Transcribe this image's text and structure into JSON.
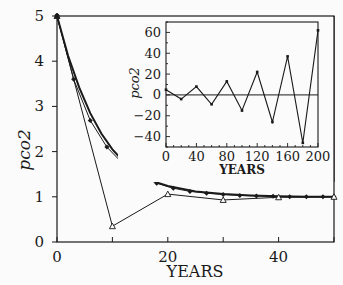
{
  "chart_data": [
    {
      "type": "line",
      "title": "",
      "xlabel": "YEARS",
      "ylabel": "pco2",
      "xlim": [
        0,
        50
      ],
      "ylim": [
        0,
        5
      ],
      "xticks": [
        0,
        20,
        40
      ],
      "yticks": [
        0,
        1,
        2,
        3,
        4,
        5
      ],
      "grid": false,
      "legend": null,
      "series": [
        {
          "name": "exact (thick line)",
          "marker": "none",
          "x": [
            0,
            2,
            4,
            6,
            8,
            10,
            12,
            14,
            16,
            18,
            20,
            25,
            30,
            35,
            40,
            45,
            50
          ],
          "values": [
            5.0,
            4.12,
            3.42,
            2.85,
            2.4,
            2.05,
            1.78,
            1.57,
            1.43,
            1.32,
            1.24,
            1.12,
            1.06,
            1.03,
            1.01,
            1.0,
            1.0
          ]
        },
        {
          "name": "dt=3 (diamonds)",
          "marker": "diamond",
          "x": [
            0,
            3,
            6,
            9,
            12,
            15,
            18,
            21,
            24,
            27,
            30,
            33,
            36,
            39,
            42,
            45,
            48,
            50
          ],
          "values": [
            5.0,
            3.6,
            2.69,
            2.1,
            1.72,
            1.47,
            1.3,
            1.19,
            1.12,
            1.08,
            1.05,
            1.03,
            1.02,
            1.01,
            1.0,
            1.0,
            1.0,
            1.0
          ]
        },
        {
          "name": "dt=10 (triangles)",
          "marker": "triangle",
          "x": [
            0,
            10,
            20,
            30,
            40,
            50
          ],
          "values": [
            5.0,
            0.35,
            1.06,
            0.93,
            0.99,
            1.0
          ]
        }
      ]
    },
    {
      "type": "line",
      "title": "inset",
      "xlabel": "YEARS",
      "ylabel": "pco2",
      "xlim": [
        0,
        200
      ],
      "ylim": [
        -50,
        70
      ],
      "xticks": [
        0,
        40,
        80,
        120,
        160,
        200
      ],
      "yticks": [
        -40,
        -20,
        0,
        20,
        40,
        60
      ],
      "grid": false,
      "reference_line": 0,
      "series": [
        {
          "name": "unstable oscillation",
          "marker": "dot",
          "x": [
            0,
            20,
            40,
            60,
            80,
            100,
            120,
            140,
            160,
            180,
            200
          ],
          "values": [
            5,
            -4,
            8,
            -9,
            13,
            -15,
            22,
            -26,
            37,
            -46,
            62
          ]
        }
      ]
    }
  ],
  "labels": {
    "main_xlabel": "YEARS",
    "main_ylabel": "pco2",
    "inset_xlabel": "YEARS",
    "inset_ylabel": "pco2",
    "main_xticks": [
      "0",
      "20",
      "40"
    ],
    "main_yticks": [
      "0",
      "1",
      "2",
      "3",
      "4",
      "5"
    ],
    "inset_xticks": [
      "0",
      "40",
      "80",
      "120",
      "160",
      "200"
    ],
    "inset_yticks": [
      "-40",
      "-20",
      "0",
      "20",
      "40",
      "60"
    ]
  },
  "colors": {
    "line": "#1a1a1a",
    "background": "#fbfbfb"
  }
}
